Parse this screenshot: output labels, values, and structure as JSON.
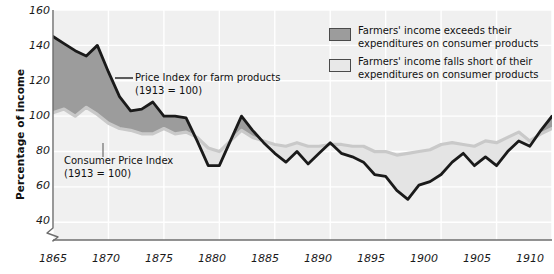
{
  "chart_data": {
    "type": "area",
    "title": "",
    "xlabel": "",
    "ylabel": "Percentage of income",
    "xlim": [
      1865,
      1910
    ],
    "ylim": [
      30,
      160
    ],
    "yticks": [
      40,
      60,
      80,
      100,
      120,
      140,
      160
    ],
    "xticks": [
      1865,
      1870,
      1875,
      1880,
      1885,
      1890,
      1895,
      1900,
      1905,
      1910
    ],
    "grid": true,
    "axis_break": true,
    "legend_position": "top-right",
    "x": [
      1865,
      1866,
      1867,
      1868,
      1869,
      1870,
      1871,
      1872,
      1873,
      1874,
      1875,
      1876,
      1877,
      1878,
      1879,
      1880,
      1881,
      1882,
      1883,
      1884,
      1885,
      1886,
      1887,
      1888,
      1889,
      1890,
      1891,
      1892,
      1893,
      1894,
      1895,
      1896,
      1897,
      1898,
      1899,
      1900,
      1901,
      1902,
      1903,
      1904,
      1905,
      1906,
      1907,
      1908,
      1909,
      1910
    ],
    "series": [
      {
        "name": "Price Index for farm products (1913 = 100)",
        "color": "#1a1a1a",
        "values": [
          145,
          141,
          137,
          134,
          140,
          125,
          111,
          103,
          104,
          108,
          100,
          100,
          99,
          86,
          72,
          72,
          86,
          100,
          92,
          85,
          79,
          74,
          80,
          73,
          79,
          85,
          79,
          77,
          74,
          67,
          66,
          58,
          53,
          61,
          63,
          67,
          74,
          79,
          72,
          77,
          72,
          80,
          86,
          83,
          92,
          100
        ]
      },
      {
        "name": "Consumer Price Index (1913 = 100)",
        "color": "#c9c9c9",
        "values": [
          102,
          104,
          100,
          105,
          101,
          96,
          93,
          92,
          90,
          90,
          93,
          90,
          91,
          88,
          82,
          80,
          86,
          92,
          88,
          86,
          84,
          83,
          85,
          83,
          83,
          84,
          84,
          83,
          83,
          80,
          80,
          78,
          79,
          80,
          81,
          84,
          85,
          84,
          83,
          86,
          85,
          88,
          91,
          86,
          90,
          93
        ]
      }
    ],
    "fill_above": {
      "label": "Farmers' income exceeds their expenditures on consumer products",
      "color": "#9c9c9c"
    },
    "fill_below": {
      "label": "Farmers' income falls short of their expenditures on consumer products",
      "color": "#e4e4e4"
    }
  },
  "yaxis": {
    "title": "Percentage of income",
    "ticks": [
      "160",
      "140",
      "120",
      "100",
      "80",
      "60",
      "40"
    ]
  },
  "xaxis": {
    "ticks": [
      "1865",
      "1870",
      "1875",
      "1880",
      "1885",
      "1890",
      "1895",
      "1900",
      "1905",
      "1910"
    ]
  },
  "annotations": {
    "farm": {
      "line1": "Price Index for farm products",
      "line2": "(1913 = 100)"
    },
    "cpi": {
      "line1": "Consumer Price Index",
      "line2": "(1913 = 100)"
    }
  },
  "legend": {
    "items": [
      {
        "line1": "Farmers' income exceeds their",
        "line2": "expenditures on consumer products",
        "color": "#9c9c9c"
      },
      {
        "line1": "Farmers' income falls short of their",
        "line2": "expenditures on consumer products",
        "color": "#e8e8e8"
      }
    ]
  },
  "colors": {
    "plot_background": "#f0f0f0",
    "gridline": "#ffffff",
    "axis": "#6e6e6e",
    "farm_line": "#1a1a1a",
    "cpi_line": "#c9c9c9"
  }
}
